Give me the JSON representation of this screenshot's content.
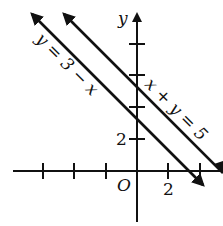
{
  "figure": {
    "axes": {
      "x_label": "",
      "y_label": "y",
      "origin_label": "O",
      "x_tick_label": "2",
      "y_tick_label": "2",
      "unit_px": 16,
      "tick_step": 2,
      "origin_px": [
        137,
        171
      ]
    },
    "lines": [
      {
        "id": "line-1",
        "equation": "y = 3 − x",
        "label_text": "y = 3 − x",
        "slope": -1,
        "intercept": 3
      },
      {
        "id": "line-2",
        "equation": "x + y = 5",
        "label_text": "x + y = 5",
        "slope": -1,
        "intercept": 5
      }
    ],
    "colors": {
      "ink": "#111111",
      "background": "#ffffff"
    }
  }
}
